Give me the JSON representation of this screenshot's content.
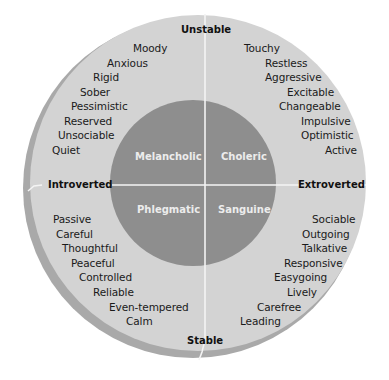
{
  "axes": {
    "top": "Unstable",
    "bottom": "Stable",
    "left": "Introverted",
    "right": "Extroverted"
  },
  "temperaments": {
    "top_left": "Melancholic",
    "top_right": "Choleric",
    "bottom_left": "Phlegmatic",
    "bottom_right": "Sanguine"
  },
  "traits": {
    "top_left": [
      "Moody",
      "Anxious",
      "Rigid",
      "Sober",
      "Pessimistic",
      "Reserved",
      "Unsociable",
      "Quiet"
    ],
    "top_right": [
      "Touchy",
      "Restless",
      "Aggressive",
      "Excitable",
      "Changeable",
      "Impulsive",
      "Optimistic",
      "Active"
    ],
    "bottom_left": [
      "Passive",
      "Careful",
      "Thoughtful",
      "Peaceful",
      "Controlled",
      "Reliable",
      "Even-tempered",
      "Calm"
    ],
    "bottom_right": [
      "Sociable",
      "Outgoing",
      "Talkative",
      "Responsive",
      "Easygoing",
      "Lively",
      "Carefree",
      "Leading"
    ]
  },
  "colors": {
    "outer_ring": "#d3d3d3",
    "shadow_rim": "#a9a9a9",
    "inner_circle": "#8e8e8e",
    "divider": "#f4f4f4"
  }
}
